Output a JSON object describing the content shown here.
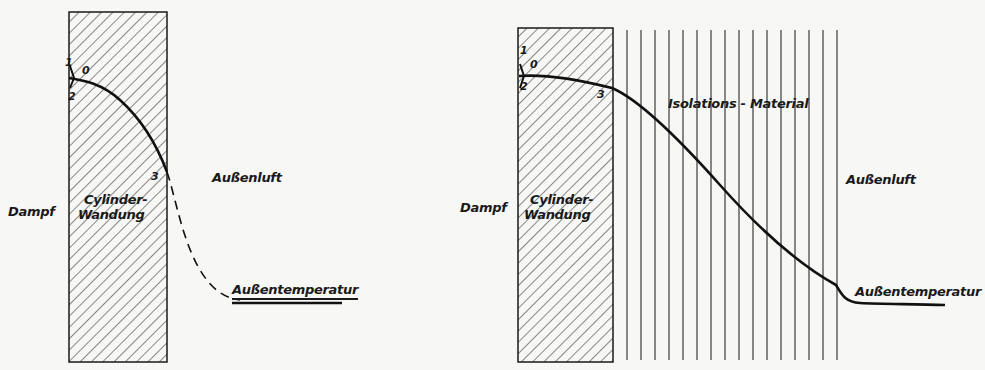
{
  "figure_left": {
    "regions": {
      "inside": "Dampf",
      "wall_line1": "Cylinder-",
      "wall_line2": "Wandung",
      "outside": "Außenluft"
    },
    "points": {
      "p1": "1",
      "p0": "0",
      "p2": "2",
      "p3": "3"
    },
    "end_label": "Außentemperatur",
    "curve_style": "solid in wall, dashed in air"
  },
  "figure_right": {
    "regions": {
      "inside": "Dampf",
      "wall_line1": "Cylinder-",
      "wall_line2": "Wandung",
      "insulation": "Isolations - Material",
      "outside": "Außenluft"
    },
    "points": {
      "p1": "1",
      "p0": "0",
      "p2": "2",
      "p3": "3"
    },
    "end_label": "Außentemperatur",
    "curve_style": "solid"
  },
  "colors": {
    "ink": "#1a1a1a",
    "paper": "#f7f7f5"
  }
}
